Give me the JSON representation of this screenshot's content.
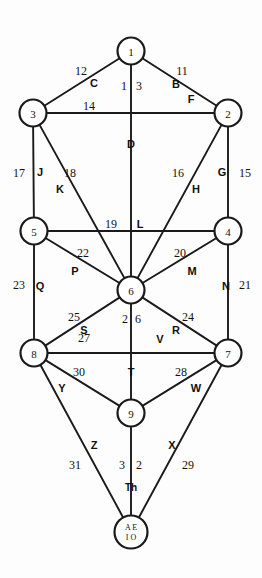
{
  "diagram": {
    "stroke_color": "#1a1a1a",
    "fill_color": "#ffffff",
    "background": "#fdfdfd",
    "nodes": [
      {
        "id": "1",
        "label": "1",
        "cx": 131,
        "cy": 51,
        "r": 13.5
      },
      {
        "id": "2",
        "label": "2",
        "cx": 228,
        "cy": 113,
        "r": 13.5
      },
      {
        "id": "3",
        "label": "3",
        "cx": 33,
        "cy": 113,
        "r": 13.5
      },
      {
        "id": "4",
        "label": "4",
        "cx": 228,
        "cy": 231,
        "r": 13.5
      },
      {
        "id": "5",
        "label": "5",
        "cx": 34,
        "cy": 231,
        "r": 13.5
      },
      {
        "id": "6",
        "label": "6",
        "cx": 131,
        "cy": 290,
        "r": 13.5
      },
      {
        "id": "7",
        "label": "7",
        "cx": 228,
        "cy": 353,
        "r": 13.5
      },
      {
        "id": "8",
        "label": "8",
        "cx": 34,
        "cy": 353,
        "r": 13.5
      },
      {
        "id": "9",
        "label": "9",
        "cx": 131,
        "cy": 413,
        "r": 13.5
      },
      {
        "id": "10",
        "label_line1": "A E",
        "label_line2": "I O",
        "cx": 131,
        "cy": 532,
        "r": 16.5
      }
    ],
    "edges": [
      {
        "from": "1",
        "to": "3",
        "number": "11",
        "letter": "C",
        "note": "left upper"
      },
      {
        "from": "1",
        "to": "2",
        "number": "12",
        "letter": "B",
        "note": "right upper"
      },
      {
        "from": "1",
        "to": "6",
        "number": "13",
        "letter": "D",
        "note": "central pillar"
      },
      {
        "from": "3",
        "to": "2",
        "number": "14",
        "letter": "F",
        "note": "upper horizontal"
      },
      {
        "from": "2",
        "to": "4",
        "number": "15",
        "letter": "G",
        "note": "right pillar"
      },
      {
        "from": "2",
        "to": "6",
        "number": "16",
        "letter": "H",
        "note": "diagonal"
      },
      {
        "from": "3",
        "to": "5",
        "number": "17",
        "letter": "J",
        "note": "left pillar"
      },
      {
        "from": "3",
        "to": "6",
        "number": "18",
        "letter": "K",
        "note": "diagonal"
      },
      {
        "from": "5",
        "to": "4",
        "number": "19",
        "letter": "L",
        "note": "middle horizontal"
      },
      {
        "from": "4",
        "to": "6",
        "number": "20",
        "letter": "M",
        "note": "diagonal"
      },
      {
        "from": "4",
        "to": "7",
        "number": "21",
        "letter": "N",
        "note": "right pillar"
      },
      {
        "from": "5",
        "to": "6",
        "number": "22",
        "letter": "P",
        "note": "diagonal"
      },
      {
        "from": "5",
        "to": "8",
        "number": "23",
        "letter": "Q",
        "note": "left pillar"
      },
      {
        "from": "6",
        "to": "7",
        "number": "24",
        "letter": "R",
        "note": "diagonal"
      },
      {
        "from": "6",
        "to": "8",
        "number": "25",
        "letter": "S",
        "note": "diagonal"
      },
      {
        "from": "6",
        "to": "9",
        "number": "26",
        "letter": "T",
        "note": "central pillar"
      },
      {
        "from": "8",
        "to": "7",
        "number": "27",
        "letter": "V",
        "note": "lower horizontal"
      },
      {
        "from": "7",
        "to": "9",
        "number": "28",
        "letter": "W",
        "note": "diagonal"
      },
      {
        "from": "7",
        "to": "10",
        "number": "29",
        "letter": "X",
        "note": "right lower"
      },
      {
        "from": "8",
        "to": "9",
        "number": "30",
        "letter": "Y",
        "note": "diagonal"
      },
      {
        "from": "8",
        "to": "10",
        "number": "31",
        "letter": "Z",
        "note": "left lower"
      },
      {
        "from": "9",
        "to": "10",
        "number": "32",
        "letter": "Th",
        "note": "central pillar"
      }
    ],
    "number_labels": [
      {
        "text": "12",
        "x": 81,
        "y": 71
      },
      {
        "text": "11",
        "x": 182,
        "y": 71
      },
      {
        "text": "1",
        "x": 124,
        "y": 86
      },
      {
        "text": "3",
        "x": 139,
        "y": 86
      },
      {
        "text": "14",
        "x": 89,
        "y": 106
      },
      {
        "text": "17",
        "x": 19,
        "y": 173
      },
      {
        "text": "18",
        "x": 70,
        "y": 173
      },
      {
        "text": "16",
        "x": 178,
        "y": 173
      },
      {
        "text": "15",
        "x": 245,
        "y": 173
      },
      {
        "text": "19",
        "x": 111,
        "y": 224
      },
      {
        "text": "22",
        "x": 83,
        "y": 253
      },
      {
        "text": "20",
        "x": 180,
        "y": 253
      },
      {
        "text": "23",
        "x": 19,
        "y": 285
      },
      {
        "text": "21",
        "x": 245,
        "y": 285
      },
      {
        "text": "25",
        "x": 74,
        "y": 317
      },
      {
        "text": "2",
        "x": 125,
        "y": 319
      },
      {
        "text": "6",
        "x": 138,
        "y": 319
      },
      {
        "text": "24",
        "x": 188,
        "y": 317
      },
      {
        "text": "27",
        "x": 84,
        "y": 338
      },
      {
        "text": "30",
        "x": 79,
        "y": 372
      },
      {
        "text": "28",
        "x": 181,
        "y": 372
      },
      {
        "text": "31",
        "x": 75,
        "y": 465
      },
      {
        "text": "3",
        "x": 122,
        "y": 465
      },
      {
        "text": "2",
        "x": 139,
        "y": 465
      },
      {
        "text": "29",
        "x": 188,
        "y": 465
      }
    ],
    "letter_labels": [
      {
        "text": "C",
        "x": 94,
        "y": 83
      },
      {
        "text": "B",
        "x": 176,
        "y": 84
      },
      {
        "text": "F",
        "x": 191,
        "y": 99
      },
      {
        "text": "D",
        "x": 131,
        "y": 144
      },
      {
        "text": "J",
        "x": 40,
        "y": 172
      },
      {
        "text": "K",
        "x": 60,
        "y": 189
      },
      {
        "text": "H",
        "x": 196,
        "y": 189
      },
      {
        "text": "G",
        "x": 222,
        "y": 172
      },
      {
        "text": "L",
        "x": 140,
        "y": 224
      },
      {
        "text": "P",
        "x": 75,
        "y": 271
      },
      {
        "text": "M",
        "x": 192,
        "y": 271
      },
      {
        "text": "Q",
        "x": 40,
        "y": 286
      },
      {
        "text": "N",
        "x": 226,
        "y": 286
      },
      {
        "text": "S",
        "x": 84,
        "y": 330
      },
      {
        "text": "R",
        "x": 176,
        "y": 330
      },
      {
        "text": "V",
        "x": 160,
        "y": 339
      },
      {
        "text": "T",
        "x": 131,
        "y": 372
      },
      {
        "text": "Y",
        "x": 62,
        "y": 388
      },
      {
        "text": "W",
        "x": 196,
        "y": 388
      },
      {
        "text": "Z",
        "x": 94,
        "y": 445
      },
      {
        "text": "X",
        "x": 172,
        "y": 445
      },
      {
        "text": "Th",
        "x": 131,
        "y": 487
      }
    ]
  }
}
